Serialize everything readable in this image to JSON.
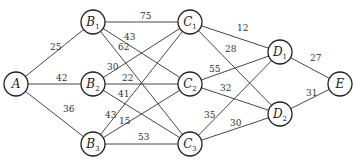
{
  "graph": {
    "nodes": [
      {
        "id": "A",
        "name": "A",
        "sub": "",
        "x": 16,
        "y": 84
      },
      {
        "id": "B1",
        "name": "B",
        "sub": "1",
        "x": 93,
        "y": 22
      },
      {
        "id": "B2",
        "name": "B",
        "sub": "2",
        "x": 93,
        "y": 84
      },
      {
        "id": "B3",
        "name": "B",
        "sub": "3",
        "x": 93,
        "y": 144
      },
      {
        "id": "C1",
        "name": "C",
        "sub": "1",
        "x": 190,
        "y": 22
      },
      {
        "id": "C2",
        "name": "C",
        "sub": "2",
        "x": 190,
        "y": 84
      },
      {
        "id": "C3",
        "name": "C",
        "sub": "3",
        "x": 190,
        "y": 144
      },
      {
        "id": "D1",
        "name": "D",
        "sub": "1",
        "x": 280,
        "y": 52
      },
      {
        "id": "D2",
        "name": "D",
        "sub": "2",
        "x": 280,
        "y": 114
      },
      {
        "id": "E",
        "name": "E",
        "sub": "",
        "x": 340,
        "y": 84
      }
    ],
    "edges": [
      {
        "from": "A",
        "to": "B1",
        "weight": "25",
        "lx": 50,
        "ly": 50
      },
      {
        "from": "A",
        "to": "B2",
        "weight": "42",
        "lx": 56,
        "ly": 81
      },
      {
        "from": "A",
        "to": "B3",
        "weight": "36",
        "lx": 63,
        "ly": 112
      },
      {
        "from": "B1",
        "to": "C1",
        "weight": "75",
        "lx": 140,
        "ly": 19
      },
      {
        "from": "B1",
        "to": "C2",
        "weight": "43",
        "lx": 124,
        "ly": 40
      },
      {
        "from": "B1",
        "to": "C3",
        "weight": "62",
        "lx": 118,
        "ly": 50
      },
      {
        "from": "B2",
        "to": "C1",
        "weight": "30",
        "lx": 107,
        "ly": 70
      },
      {
        "from": "B2",
        "to": "C2",
        "weight": "22",
        "lx": 122,
        "ly": 81
      },
      {
        "from": "B2",
        "to": "C3",
        "weight": "41",
        "lx": 118,
        "ly": 97
      },
      {
        "from": "B3",
        "to": "C1",
        "weight": "43",
        "lx": 105,
        "ly": 118
      },
      {
        "from": "B3",
        "to": "C2",
        "weight": "15",
        "lx": 119,
        "ly": 124
      },
      {
        "from": "B3",
        "to": "C3",
        "weight": "53",
        "lx": 138,
        "ly": 140
      },
      {
        "from": "C1",
        "to": "D1",
        "weight": "12",
        "lx": 237,
        "ly": 31
      },
      {
        "from": "C1",
        "to": "D2",
        "weight": "28",
        "lx": 225,
        "ly": 52
      },
      {
        "from": "C2",
        "to": "D1",
        "weight": "55",
        "lx": 209,
        "ly": 72
      },
      {
        "from": "C2",
        "to": "D2",
        "weight": "32",
        "lx": 220,
        "ly": 91
      },
      {
        "from": "C3",
        "to": "D1",
        "weight": "35",
        "lx": 204,
        "ly": 118
      },
      {
        "from": "C3",
        "to": "D2",
        "weight": "30",
        "lx": 230,
        "ly": 126
      },
      {
        "from": "D1",
        "to": "E",
        "weight": "27",
        "lx": 310,
        "ly": 61
      },
      {
        "from": "D2",
        "to": "E",
        "weight": "31",
        "lx": 306,
        "ly": 96
      }
    ]
  }
}
